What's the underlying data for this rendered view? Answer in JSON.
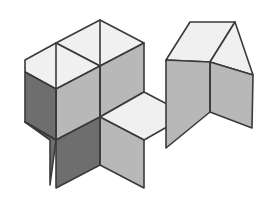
{
  "figure": {
    "background_color": "#ffffff",
    "projection": "isometric",
    "outline_color": "#3a3a3a",
    "outline_width": 1.6,
    "canvas": {
      "width": 268,
      "height": 205
    },
    "palette": {
      "top_face": "#f0f0f0",
      "right_face": "#b8b8b8",
      "left_face": "#6e6e6e",
      "left_face_alt": "#777777",
      "top_face_alt": "#eaeaea"
    },
    "counts": {
      "total_cubes": 5,
      "left_group_cubes": 3,
      "right_group_cubes": 2
    },
    "groups": [
      {
        "name": "left-group",
        "label": "L-shaped cluster",
        "cube_count": 3,
        "visible_face_kinds": [
          "top",
          "right",
          "left"
        ]
      },
      {
        "name": "right-group",
        "label": "Two-cube row",
        "cube_count": 2,
        "visible_face_kinds": [
          "top",
          "right"
        ]
      }
    ],
    "faces": [
      {
        "id": "lg-top-back",
        "group": "left-group",
        "kind": "top",
        "fill": "#f0f0f0",
        "points": "100,20 144,43 100,66 56,43"
      },
      {
        "id": "lg-top-front",
        "group": "left-group",
        "kind": "top",
        "fill": "#f0f0f0",
        "points": "56,43 100,66 56,89 25,72 25,60"
      },
      {
        "id": "lg-right-upper",
        "group": "left-group",
        "kind": "right",
        "fill": "#b8b8b8",
        "points": "144,43 144,92 100,117 100,66"
      },
      {
        "id": "lg-right-lower",
        "group": "left-group",
        "kind": "right",
        "fill": "#b8b8b8",
        "points": "100,66 100,117 56,140 56,89"
      },
      {
        "id": "lg-left-upper",
        "group": "left-group",
        "kind": "left",
        "fill": "#6e6e6e",
        "points": "25,72 56,89 56,140 25,122"
      },
      {
        "id": "lg-left-lower",
        "group": "left-group",
        "kind": "left",
        "fill": "#6e6e6e",
        "points": "25,122 56,140 50,185 50,140"
      },
      {
        "id": "lg-step-top",
        "group": "left-group",
        "kind": "top",
        "fill": "#f0f0f0",
        "points": "100,117 144,92 188,115 144,140"
      },
      {
        "id": "lg-step-left",
        "group": "left-group",
        "kind": "left",
        "fill": "#6e6e6e",
        "points": "56,140 100,117 100,165 56,188"
      },
      {
        "id": "lg-step-right",
        "group": "left-group",
        "kind": "right",
        "fill": "#b8b8b8",
        "points": "100,117 144,140 144,188 100,165"
      },
      {
        "id": "rg-top-left",
        "group": "right-group",
        "kind": "top",
        "fill": "#f0f0f0",
        "points": "190,22 235,22 210,62 166,60"
      },
      {
        "id": "rg-top-right",
        "group": "right-group",
        "kind": "top",
        "fill": "#f0f0f0",
        "points": "235,22 253,75 210,62"
      },
      {
        "id": "rg-right-far",
        "group": "right-group",
        "kind": "right",
        "fill": "#b8b8b8",
        "points": "210,62 253,75 252,128 210,112"
      },
      {
        "id": "rg-right-near",
        "group": "right-group",
        "kind": "right",
        "fill": "#b8b8b8",
        "points": "166,60 210,62 210,112 166,148"
      }
    ],
    "edges": [
      {
        "id": "edge-lg-ridge",
        "from": [
          100,
          20
        ],
        "to": [
          100,
          66
        ]
      },
      {
        "id": "edge-lg-vertical",
        "from": [
          56,
          43
        ],
        "to": [
          56,
          140
        ]
      },
      {
        "id": "edge-lg-mid",
        "from": [
          100,
          66
        ],
        "to": [
          100,
          165
        ]
      },
      {
        "id": "edge-lg-left-mid",
        "from": [
          25,
          122
        ],
        "to": [
          56,
          140
        ]
      },
      {
        "id": "edge-rg-ridge",
        "from": [
          210,
          62
        ],
        "to": [
          210,
          112
        ]
      }
    ]
  }
}
